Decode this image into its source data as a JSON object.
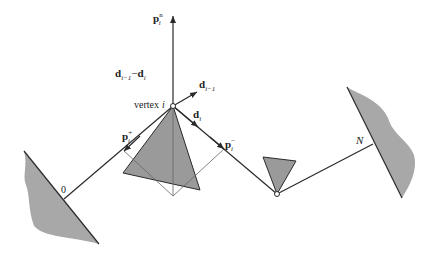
{
  "diagram": {
    "colors": {
      "line": "#2a2a2a",
      "fill": "#9a9a9a",
      "thin": "#555555"
    },
    "labels": {
      "p_n": {
        "main": "p",
        "sup": "n",
        "sub": "i"
      },
      "d_diff": {
        "a": "d",
        "a_sub": "i−1",
        "minus": "−",
        "b": "d",
        "b_sub": "i"
      },
      "d_prev": {
        "main": "d",
        "sub": "i−1"
      },
      "vertex": {
        "text": "vertex",
        "index": "i"
      },
      "d_i": {
        "main": "d",
        "sub": "i"
      },
      "p_plus": {
        "main": "p",
        "sup": "+",
        "sub": "i"
      },
      "p_minus": {
        "main": "p",
        "sup": "−",
        "sub": "i"
      },
      "start": "0",
      "end": "N"
    }
  }
}
